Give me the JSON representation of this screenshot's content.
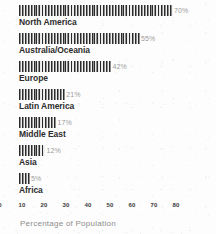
{
  "chart_data": {
    "type": "bar",
    "orientation": "horizontal",
    "title": "",
    "subtitle": "",
    "xlabel": "Percentage of Population",
    "ylabel": "",
    "categories": [
      "North America",
      "Australia/Oceania",
      "Europe",
      "Latin America",
      "Middle East",
      "Asia",
      "Africa"
    ],
    "values": [
      70,
      55,
      42,
      21,
      17,
      12,
      5
    ],
    "value_labels": [
      "70%",
      "55%",
      "42%",
      "21%",
      "17%",
      "12%",
      "5%"
    ],
    "xlim": [
      0,
      80
    ],
    "xticks": [
      0,
      10,
      20,
      30,
      40,
      50,
      60,
      70,
      80
    ],
    "xtick_labels": [
      "0",
      "10",
      "20",
      "30",
      "40",
      "50",
      "60",
      "70",
      "80"
    ],
    "grid": false,
    "legend": null,
    "bar_fill": "striped-hatch",
    "colors": {
      "bar_dark": "#2b2b2b",
      "bar_light": "#e8e8e8",
      "value_label": "#9b9b9b",
      "category_label": "#2d2d2d",
      "tick_label": "#3a3a3a",
      "axis_caption": "#8d8d8d",
      "background": "#fdfdfd"
    }
  },
  "axis": {
    "caption": "Percentage of Population"
  }
}
